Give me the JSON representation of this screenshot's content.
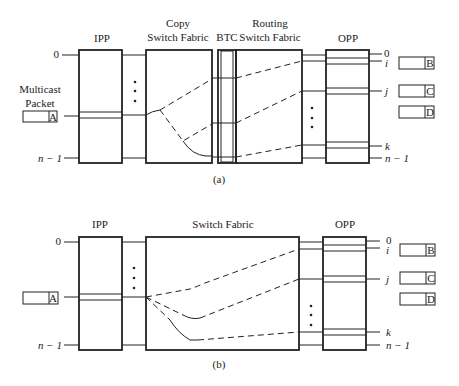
{
  "diagram_a": {
    "caption": "(a)",
    "ipp_label": "IPP",
    "copy_fabric_label_1": "Copy",
    "copy_fabric_label_2": "Switch Fabric",
    "btc_label": "BTC",
    "routing_fabric_label_1": "Routing",
    "routing_fabric_label_2": "Switch Fabric",
    "opp_label": "OPP",
    "input_labels": {
      "top": "0",
      "bottom": "n − 1"
    },
    "output_labels": {
      "o0": "0",
      "oi": "i",
      "oj": "j",
      "ok": "k",
      "on": "n − 1"
    },
    "multicast_label_1": "Multicast",
    "multicast_label_2": "Packet",
    "packets": {
      "in": "A",
      "out_b": "B",
      "out_c": "C",
      "out_d": "D"
    },
    "dots": "•"
  },
  "diagram_b": {
    "caption": "(b)",
    "ipp_label": "IPP",
    "fabric_label": "Switch Fabric",
    "opp_label": "OPP",
    "input_labels": {
      "top": "0",
      "bottom": "n − 1"
    },
    "output_labels": {
      "o0": "0",
      "oi": "i",
      "oj": "j",
      "ok": "k",
      "on": "n − 1"
    },
    "packets": {
      "in": "A",
      "out_b": "B",
      "out_c": "C",
      "out_d": "D"
    }
  }
}
